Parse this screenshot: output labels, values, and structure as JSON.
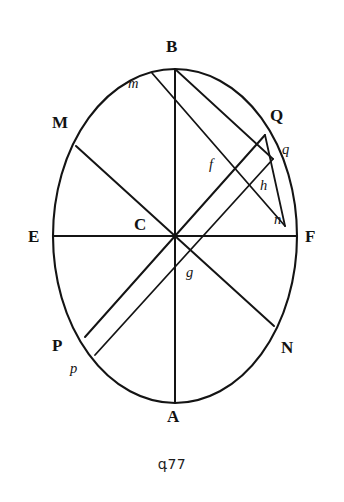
{
  "figure": {
    "caption": "գ77",
    "caption_text": "գ77",
    "shape": "ellipse",
    "ellipse": {
      "cx": 175,
      "cy": 236,
      "rx": 122,
      "ry": 167,
      "stroke_color": "#141414",
      "fill_color": "#ffffff"
    },
    "background_color": "#ffffff",
    "line_color": "#141414"
  },
  "labels": {
    "B": "B",
    "A": "A",
    "E": "E",
    "F": "F",
    "M": "M",
    "N": "N",
    "P": "P",
    "Q": "Q",
    "C": "C",
    "m": "m",
    "n": "n",
    "p": "p",
    "q": "q",
    "f": "f",
    "g": "g",
    "h": "h"
  },
  "points": [
    {
      "id": "B",
      "label": "B",
      "x": 175,
      "y": 69,
      "kind": "major-axis-end",
      "label_x": 166,
      "label_y": 38
    },
    {
      "id": "A",
      "label": "A",
      "x": 175,
      "y": 403,
      "kind": "major-axis-end",
      "label_x": 167,
      "label_y": 408
    },
    {
      "id": "E",
      "label": "E",
      "x": 53,
      "y": 236,
      "kind": "minor-axis-end",
      "label_x": 28,
      "label_y": 228
    },
    {
      "id": "F",
      "label": "F",
      "x": 297,
      "y": 236,
      "kind": "minor-axis-end",
      "label_x": 305,
      "label_y": 228
    },
    {
      "id": "M",
      "label": "M",
      "x": 76,
      "y": 146,
      "kind": "diameter-end",
      "label_x": 52,
      "label_y": 114
    },
    {
      "id": "N",
      "label": "N",
      "x": 274,
      "y": 326,
      "kind": "diameter-end",
      "label_x": 281,
      "label_y": 339
    },
    {
      "id": "P",
      "label": "P",
      "x": 85,
      "y": 337,
      "kind": "diameter-end",
      "label_x": 52,
      "label_y": 337
    },
    {
      "id": "Q",
      "label": "Q",
      "x": 265,
      "y": 135,
      "kind": "diameter-end",
      "label_x": 270,
      "label_y": 107
    },
    {
      "id": "C",
      "label": "C",
      "x": 175,
      "y": 236,
      "kind": "center",
      "label_x": 134,
      "label_y": 216
    },
    {
      "id": "m",
      "label": "m",
      "x": 152,
      "y": 73,
      "kind": "chord-end",
      "label_x": 128,
      "label_y": 76
    },
    {
      "id": "n",
      "label": "n",
      "x": 285,
      "y": 226,
      "kind": "chord-end",
      "label_x": 274,
      "label_y": 212
    },
    {
      "id": "p",
      "label": "p",
      "x": 95,
      "y": 355,
      "kind": "chord-end",
      "label_x": 70,
      "label_y": 361
    },
    {
      "id": "q",
      "label": "q",
      "x": 273,
      "y": 159,
      "kind": "chord-end",
      "label_x": 282,
      "label_y": 142
    },
    {
      "id": "f",
      "label": "f",
      "x": 222,
      "y": 172,
      "kind": "intersection",
      "label_x": 209,
      "label_y": 157
    },
    {
      "id": "g",
      "label": "g",
      "x": 196,
      "y": 274,
      "kind": "intersection",
      "label_x": 186,
      "label_y": 265
    },
    {
      "id": "h",
      "label": "h",
      "x": 255,
      "y": 190,
      "kind": "intersection",
      "label_x": 260,
      "label_y": 178
    }
  ],
  "segments": [
    {
      "id": "BA",
      "from": "B",
      "to": "A",
      "role": "major-axis",
      "x1": 175,
      "y1": 69,
      "x2": 175,
      "y2": 403
    },
    {
      "id": "EF",
      "from": "E",
      "to": "F",
      "role": "minor-axis",
      "x1": 53,
      "y1": 236,
      "x2": 297,
      "y2": 236
    },
    {
      "id": "MN",
      "from": "M",
      "to": "N",
      "role": "conjugate-diameter",
      "x1": 76,
      "y1": 146,
      "x2": 274,
      "y2": 326
    },
    {
      "id": "PQ",
      "from": "P",
      "to": "Q",
      "role": "conjugate-diameter",
      "x1": 85,
      "y1": 337,
      "x2": 265,
      "y2": 135
    },
    {
      "id": "mN",
      "from": "m",
      "to": "n",
      "role": "chord",
      "x1": 152,
      "y1": 73,
      "x2": 285,
      "y2": 226
    },
    {
      "id": "pQ",
      "from": "p",
      "to": "q",
      "role": "chord",
      "x1": 95,
      "y1": 355,
      "x2": 273,
      "y2": 159
    },
    {
      "id": "Qn",
      "from": "Q",
      "to": "n",
      "role": "chord",
      "x1": 265,
      "y1": 135,
      "x2": 285,
      "y2": 226
    },
    {
      "id": "qm",
      "from": "q",
      "to": "B",
      "role": "chord",
      "x1": 273,
      "y1": 159,
      "x2": 175,
      "y2": 69
    }
  ]
}
